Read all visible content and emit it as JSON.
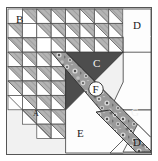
{
  "figure": {
    "type": "diagram",
    "canvas": {
      "width": 158,
      "height": 161
    },
    "frame": {
      "x": 6,
      "y": 7,
      "width": 146,
      "height": 148,
      "border_color": "#555555",
      "background_color": "#f1f1f1"
    },
    "grid": {
      "origin_x": 8,
      "origin_y": 9,
      "cell_size": 14.4,
      "columns": 10,
      "rows": 10,
      "cell_fill": "#ffffff",
      "triangle_fill": "#b4b4b4",
      "line_color": "#4a4a4a"
    },
    "palette": {
      "light_gray_triangle": "#b4b4b4",
      "dark_gray_region": "#4d4d4d",
      "mid_gray_region": "#6b6b6b",
      "white_region": "#fdfdfd",
      "texture_base": "#8e8e8e",
      "outline": "#3a3a3a",
      "page_background": "#ffffff"
    },
    "labels": [
      {
        "id": "A",
        "text": "A",
        "x": 36,
        "y": 114,
        "style": "dark-on-light",
        "circled": false
      },
      {
        "id": "B",
        "text": "B",
        "x": 18,
        "y": 20,
        "style": "dark-on-light",
        "circled": false
      },
      {
        "id": "C",
        "text": "C",
        "x": 97,
        "y": 63,
        "style": "light-on-dark",
        "circled": false
      },
      {
        "id": "D_top",
        "text": "D",
        "x": 136,
        "y": 26,
        "style": "dark-on-light",
        "circled": false
      },
      {
        "id": "E",
        "text": "E",
        "x": 80,
        "y": 134,
        "style": "dark-on-light",
        "circled": false
      },
      {
        "id": "F",
        "text": "F",
        "x": 96,
        "y": 92,
        "style": "dark-on-light",
        "circled": true
      },
      {
        "id": "G",
        "text": "G",
        "x": 135,
        "y": 113,
        "style": "light-on-dark",
        "circled": false
      },
      {
        "id": "D_bottom",
        "text": "D",
        "x": 136,
        "y": 143,
        "style": "dark-on-light",
        "circled": false
      }
    ],
    "regions": [
      {
        "id": "region-d-top",
        "name": "D",
        "shape": "triangle",
        "fill": "white",
        "description": "large white triangle upper right"
      },
      {
        "id": "region-c",
        "name": "C",
        "shape": "triangle",
        "fill": "dark-gray",
        "description": "dark gray triangle pointing down, center"
      },
      {
        "id": "region-band-f",
        "name": "F",
        "shape": "band",
        "fill": "textured",
        "description": "speckled diagonal band from upper-left to lower-right"
      },
      {
        "id": "region-e",
        "name": "E",
        "shape": "pentagon",
        "fill": "white",
        "description": "white house shape bottom center"
      },
      {
        "id": "region-g",
        "name": "G",
        "shape": "triangle",
        "fill": "dark-gray",
        "description": "small dark triangle right side"
      },
      {
        "id": "region-d-bottom",
        "name": "D",
        "shape": "triangle",
        "fill": "white",
        "description": "white triangle bottom right"
      },
      {
        "id": "region-a",
        "name": "A",
        "shape": "grid",
        "fill": "hatched",
        "description": "hatched triangle grid lower left"
      },
      {
        "id": "region-b",
        "name": "B",
        "shape": "grid",
        "fill": "hatched",
        "description": "hatched triangle grid upper left"
      }
    ]
  }
}
